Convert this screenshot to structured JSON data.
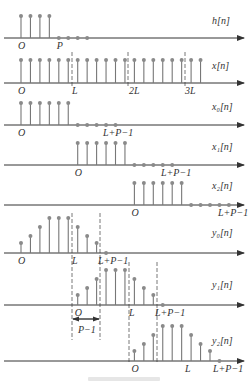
{
  "figure": {
    "dx": 9.45,
    "origin_x": 21,
    "stem_color": "#777777",
    "dot_color": "#8a8a8a",
    "axis_color": "#333333",
    "dash_color": "#555555",
    "rows": [
      {
        "name": "h",
        "label": "h[n]",
        "axis_y": 38,
        "label_y": 24,
        "stems": [
          {
            "n": 0,
            "h": 22
          },
          {
            "n": 1,
            "h": 22
          },
          {
            "n": 2,
            "h": 22
          },
          {
            "n": 3,
            "h": 22
          }
        ],
        "zeros": [
          4,
          5,
          6,
          7
        ],
        "ticks": [
          {
            "text": "O",
            "n": 0
          },
          {
            "text": "P",
            "n": 4
          }
        ]
      },
      {
        "name": "x",
        "label": "x[n]",
        "axis_y": 83,
        "label_y": 69,
        "stems_range": [
          0,
          19
        ],
        "height": 23,
        "zeros": [],
        "ticks": [
          {
            "text": "O",
            "n": 0
          },
          {
            "text": "L",
            "x": 74
          },
          {
            "text": "2L",
            "x": 131
          },
          {
            "text": "3L",
            "x": 187
          }
        ]
      },
      {
        "name": "x0",
        "label": "x₀[n]",
        "axis_y": 125,
        "label_y": 110,
        "stems_range": [
          0,
          5
        ],
        "height": 22,
        "zeros": [
          6,
          7,
          8,
          9,
          10
        ],
        "ticks": [
          {
            "text": "O",
            "n": 0
          },
          {
            "text": "L+P−1",
            "x": 105
          }
        ]
      },
      {
        "name": "x1",
        "label": "x₁[n]",
        "axis_y": 165,
        "label_y": 150,
        "stems_range": [
          6,
          11
        ],
        "height": 22,
        "zeros": [
          12,
          13,
          14,
          15,
          16
        ],
        "ticks": [
          {
            "text": "O",
            "n": 6
          },
          {
            "text": "L+P−1",
            "x": 163
          }
        ]
      },
      {
        "name": "x2",
        "label": "x₂[n]",
        "axis_y": 205,
        "label_y": 189,
        "stems_range": [
          12,
          17
        ],
        "height": 22,
        "zeros": [
          18,
          19,
          20,
          21,
          22
        ],
        "ticks": [
          {
            "text": "O",
            "n": 12
          },
          {
            "text": "L+P−1",
            "x": 220
          }
        ]
      },
      {
        "name": "y0",
        "label": "y₀[n]",
        "axis_y": 253,
        "label_y": 236,
        "stems": [
          {
            "n": 0,
            "h": 10
          },
          {
            "n": 1,
            "h": 17
          },
          {
            "n": 2,
            "h": 26
          },
          {
            "n": 3,
            "h": 35
          },
          {
            "n": 4,
            "h": 35
          },
          {
            "n": 5,
            "h": 35
          },
          {
            "n": 6,
            "h": 26
          },
          {
            "n": 7,
            "h": 17
          },
          {
            "n": 8,
            "h": 10
          }
        ],
        "zeros": [
          9
        ],
        "ticks": [
          {
            "text": "O",
            "n": 0
          },
          {
            "text": "L",
            "x": 74
          },
          {
            "text": "L+P−1",
            "x": 100
          }
        ]
      },
      {
        "name": "y1",
        "label": "y₁[n]",
        "axis_y": 305,
        "label_y": 288,
        "stems": [
          {
            "n": 6,
            "h": 10
          },
          {
            "n": 7,
            "h": 17
          },
          {
            "n": 8,
            "h": 26
          },
          {
            "n": 9,
            "h": 35
          },
          {
            "n": 10,
            "h": 35
          },
          {
            "n": 11,
            "h": 35
          },
          {
            "n": 12,
            "h": 26
          },
          {
            "n": 13,
            "h": 17
          },
          {
            "n": 14,
            "h": 10
          }
        ],
        "zeros": [
          15
        ],
        "ticks": [
          {
            "text": "O",
            "n": 6
          },
          {
            "text": "L",
            "x": 131
          },
          {
            "text": "L+P−1",
            "x": 157
          }
        ]
      },
      {
        "name": "y2",
        "label": "y₂[n]",
        "axis_y": 361,
        "label_y": 344,
        "stems": [
          {
            "n": 12,
            "h": 10
          },
          {
            "n": 13,
            "h": 17
          },
          {
            "n": 14,
            "h": 26
          },
          {
            "n": 15,
            "h": 35
          },
          {
            "n": 16,
            "h": 35
          },
          {
            "n": 17,
            "h": 35
          },
          {
            "n": 18,
            "h": 26
          },
          {
            "n": 19,
            "h": 17
          },
          {
            "n": 20,
            "h": 10
          }
        ],
        "zeros": [
          21
        ],
        "ticks": [
          {
            "text": "O",
            "n": 12
          },
          {
            "text": "L",
            "x": 187
          },
          {
            "text": "L+P−1",
            "x": 215
          }
        ]
      }
    ],
    "dashed_lines": [
      {
        "x": 72,
        "y1": 52,
        "y2": 88
      },
      {
        "x": 128,
        "y1": 52,
        "y2": 88
      },
      {
        "x": 185,
        "y1": 52,
        "y2": 88
      },
      {
        "x": 72,
        "y1": 213,
        "y2": 340
      },
      {
        "x": 100,
        "y1": 213,
        "y2": 340
      },
      {
        "x": 129,
        "y1": 262,
        "y2": 362
      },
      {
        "x": 157,
        "y1": 262,
        "y2": 362
      }
    ],
    "bracket": {
      "x1": 72,
      "x2": 100,
      "y": 319,
      "label": "P−1",
      "label_y": 333
    }
  }
}
